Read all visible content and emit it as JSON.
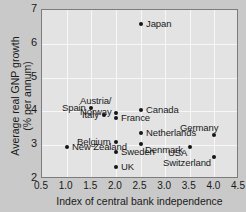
{
  "chart_data": {
    "type": "scatter",
    "title": "",
    "xlabel": "Index of central bank independence",
    "ylabel_line1": "Average real GNP growth",
    "ylabel_line2": "(% per annum)",
    "xlim": [
      0.5,
      4.5
    ],
    "ylim": [
      2,
      7
    ],
    "xticks": [
      "0.5",
      "1.0",
      "1.5",
      "2.0",
      "2.5",
      "3.0",
      "3.5",
      "4.0",
      "4.5"
    ],
    "xtick_values": [
      0.5,
      1.0,
      1.5,
      2.0,
      2.5,
      3.0,
      3.5,
      4.0,
      4.5
    ],
    "yticks": [
      "2",
      "3",
      "4",
      "5",
      "6",
      "7"
    ],
    "ytick_values": [
      2,
      3,
      4,
      5,
      6,
      7
    ],
    "grid": true,
    "legend": "none",
    "marker_color": "#151515",
    "plot_background": "#e3e3e3",
    "gridline_color": "#f7f7f7",
    "figure_background": "#c9c9c9",
    "points": [
      {
        "label": "Japan",
        "x": 2.5,
        "y": 6.6,
        "label_pos": "right"
      },
      {
        "label": "Spain",
        "x": 1.5,
        "y": 4.1,
        "label_pos": "left"
      },
      {
        "label": "Austria/",
        "label2": "Norway",
        "x": 2.0,
        "y": 3.95,
        "label_pos": "left-two"
      },
      {
        "label": "Canada",
        "x": 2.5,
        "y": 4.05,
        "label_pos": "right"
      },
      {
        "label": "Italy",
        "x": 1.75,
        "y": 3.9,
        "label_pos": "left"
      },
      {
        "label": "France",
        "x": 2.0,
        "y": 3.8,
        "label_pos": "right"
      },
      {
        "label": "Germany",
        "x": 4.0,
        "y": 3.3,
        "label_pos": "above"
      },
      {
        "label": "Netherlands",
        "x": 2.5,
        "y": 3.35,
        "label_pos": "right"
      },
      {
        "label": "Belgium",
        "x": 2.0,
        "y": 3.1,
        "label_pos": "left"
      },
      {
        "label": "Denmark",
        "x": 2.5,
        "y": 3.05,
        "label_pos": "below-right"
      },
      {
        "label": "New Zealand",
        "x": 1.0,
        "y": 2.95,
        "label_pos": "right"
      },
      {
        "label": "USA",
        "x": 3.5,
        "y": 2.95,
        "label_pos": "below-left"
      },
      {
        "label": "Sweden",
        "x": 2.0,
        "y": 2.8,
        "label_pos": "right"
      },
      {
        "label": "Switzerland",
        "x": 4.0,
        "y": 2.65,
        "label_pos": "below-left"
      },
      {
        "label": "UK",
        "x": 2.0,
        "y": 2.35,
        "label_pos": "right"
      }
    ]
  }
}
